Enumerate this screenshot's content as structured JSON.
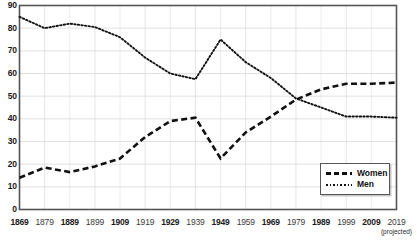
{
  "chart_data": {
    "type": "line",
    "title": "",
    "subtitle": "",
    "xlabel": "",
    "ylabel": "",
    "xlim": [
      1869,
      2019
    ],
    "ylim": [
      0,
      90
    ],
    "grid": true,
    "legend_position": "bottom-right",
    "x": [
      1869,
      1879,
      1889,
      1899,
      1909,
      1919,
      1929,
      1939,
      1949,
      1959,
      1969,
      1979,
      1989,
      1999,
      2009,
      2019
    ],
    "categories": [
      "1869",
      "1879",
      "1889",
      "1899",
      "1909",
      "1919",
      "1929",
      "1939",
      "1949",
      "1959",
      "1969",
      "1979",
      "1989",
      "1999",
      "2009",
      "2019"
    ],
    "x_tick_labels": [
      {
        "label": "1869",
        "bold": true
      },
      {
        "label": "1879",
        "bold": false
      },
      {
        "label": "1889",
        "bold": true
      },
      {
        "label": "1899",
        "bold": false
      },
      {
        "label": "1909",
        "bold": true
      },
      {
        "label": "1919",
        "bold": false
      },
      {
        "label": "1929",
        "bold": true
      },
      {
        "label": "1939",
        "bold": false
      },
      {
        "label": "1949",
        "bold": true
      },
      {
        "label": "1959",
        "bold": false
      },
      {
        "label": "1969",
        "bold": true
      },
      {
        "label": "1979",
        "bold": false
      },
      {
        "label": "1989",
        "bold": true
      },
      {
        "label": "1999",
        "bold": false
      },
      {
        "label": "2009",
        "bold": true
      },
      {
        "label": "2019",
        "bold": false
      }
    ],
    "x_axis_note": "(projected)",
    "x_axis_note_at": "2019",
    "y_ticks": [
      0,
      10,
      20,
      30,
      40,
      50,
      60,
      70,
      80,
      90
    ],
    "y_tick_labels": [
      "0",
      "10",
      "20",
      "30",
      "40",
      "50",
      "60",
      "70",
      "80",
      "90"
    ],
    "series": [
      {
        "name": "Women",
        "style": "dashed",
        "color": "#111111",
        "values": [
          14,
          18.5,
          16.5,
          19,
          22.5,
          32,
          39,
          40.5,
          22.5,
          34,
          41,
          48.5,
          53,
          55.5,
          55.5,
          56
        ]
      },
      {
        "name": "Men",
        "style": "dotted",
        "color": "#111111",
        "values": [
          85,
          80,
          82,
          80.5,
          76,
          67,
          60,
          57.5,
          75,
          65,
          58,
          49,
          45,
          41,
          41,
          40.5
        ]
      }
    ],
    "legend": [
      {
        "label": "Women",
        "style": "dashed"
      },
      {
        "label": "Men",
        "style": "dotted"
      }
    ],
    "colors": {
      "frame": "#555555",
      "grid": "#d9d9d9",
      "line": "#111111",
      "text": "#1a1a1a",
      "background": "#ffffff"
    }
  }
}
